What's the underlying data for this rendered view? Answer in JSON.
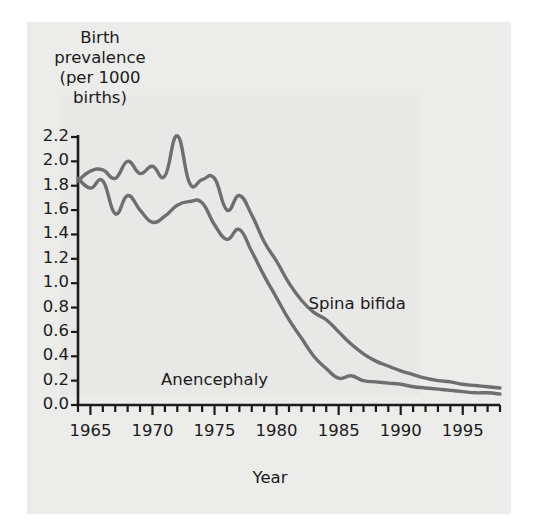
{
  "chart_data": {
    "type": "line",
    "title": "",
    "xlabel": "Year",
    "ylabel": "Birth prevalence (per 1000 births)",
    "ylabel_lines": [
      "Birth",
      "prevalence",
      "(per 1000",
      "births)"
    ],
    "xlim": [
      1964,
      1998
    ],
    "ylim": [
      0.0,
      2.2
    ],
    "grid": false,
    "legend_position": "inline-annotations",
    "ytick_labels": [
      "0.0",
      "0.2",
      "0.4",
      "0.6",
      "0.8",
      "1.0",
      "1.2",
      "1.4",
      "1.6",
      "1.8",
      "2.0",
      "2.2"
    ],
    "ytick_values": [
      0.0,
      0.2,
      0.4,
      0.6,
      0.8,
      1.0,
      1.2,
      1.4,
      1.6,
      1.8,
      2.0,
      2.2
    ],
    "xtick_labels": [
      "1965",
      "1970",
      "1975",
      "1980",
      "1985",
      "1990",
      "1995"
    ],
    "xtick_values": [
      1965,
      1970,
      1975,
      1980,
      1985,
      1990,
      1995
    ],
    "xtick_minor_step": 1,
    "line_color": "#6e6e6e",
    "axis_color": "#1b1b1b",
    "x": [
      1964,
      1965,
      1966,
      1967,
      1968,
      1969,
      1970,
      1971,
      1972,
      1973,
      1974,
      1975,
      1976,
      1977,
      1978,
      1979,
      1980,
      1981,
      1982,
      1983,
      1984,
      1985,
      1986,
      1987,
      1988,
      1989,
      1990,
      1991,
      1992,
      1993,
      1994,
      1995,
      1996,
      1997,
      1998
    ],
    "series": [
      {
        "name": "Spina bifida",
        "values": [
          1.84,
          1.92,
          1.93,
          1.86,
          2.0,
          1.9,
          1.96,
          1.88,
          2.21,
          1.82,
          1.85,
          1.86,
          1.6,
          1.72,
          1.56,
          1.34,
          1.18,
          1.0,
          0.86,
          0.76,
          0.7,
          0.6,
          0.5,
          0.42,
          0.36,
          0.32,
          0.28,
          0.25,
          0.22,
          0.2,
          0.19,
          0.17,
          0.16,
          0.15,
          0.14
        ]
      },
      {
        "name": "Anencephaly",
        "values": [
          1.86,
          1.78,
          1.84,
          1.57,
          1.72,
          1.6,
          1.5,
          1.55,
          1.64,
          1.67,
          1.66,
          1.48,
          1.36,
          1.44,
          1.26,
          1.06,
          0.88,
          0.7,
          0.55,
          0.4,
          0.3,
          0.22,
          0.24,
          0.2,
          0.19,
          0.18,
          0.17,
          0.15,
          0.14,
          0.13,
          0.12,
          0.11,
          0.1,
          0.1,
          0.09
        ]
      }
    ],
    "annotations": [
      {
        "text": "Spina bifida",
        "x": 1986.5,
        "y": 0.82
      },
      {
        "text": "Anencephaly",
        "x": 1975.0,
        "y": 0.2
      }
    ]
  }
}
